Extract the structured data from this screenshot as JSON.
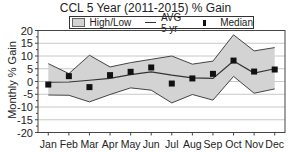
{
  "chart_data": {
    "type": "area",
    "title": "CCL 5 Year (2011-2015) % Gain",
    "xlabel": "",
    "ylabel": "Monthly % Gain",
    "ylim": [
      -20,
      20
    ],
    "yticks": [
      20,
      15,
      10,
      5,
      0,
      -5,
      -10,
      -15,
      -20
    ],
    "grid": true,
    "legend_position": "top",
    "legend": [
      "High/Low",
      "AVG 5 yr",
      "Median"
    ],
    "categories": [
      "Jan",
      "Feb",
      "Mar",
      "Apr",
      "May",
      "Jun",
      "Jul",
      "Aug",
      "Sep",
      "Oct",
      "Nov",
      "Dec"
    ],
    "series": [
      {
        "name": "High",
        "values": [
          7.0,
          3.1,
          10.3,
          5.7,
          7.4,
          8.7,
          10.0,
          6.8,
          8.0,
          18.3,
          12.0,
          13.3
        ]
      },
      {
        "name": "Low",
        "values": [
          -5.3,
          -5.4,
          -8.0,
          -5.1,
          -2.5,
          -3.4,
          -8.4,
          -5.1,
          -7.3,
          2.0,
          -4.6,
          -2.9
        ]
      },
      {
        "name": "AVG 5 yr",
        "values": [
          -0.3,
          -0.2,
          0.5,
          1.2,
          2.7,
          3.8,
          2.5,
          1.4,
          1.2,
          8.0,
          3.3,
          5.0
        ]
      },
      {
        "name": "Median",
        "values": [
          -1.2,
          2.1,
          -2.2,
          2.5,
          3.8,
          5.5,
          -0.8,
          1.2,
          3.0,
          8.2,
          3.9,
          4.7
        ]
      }
    ],
    "colors": {
      "band": "#d3d3d3",
      "band_edge": "#444444",
      "avg_line": "#333333",
      "median_marker": "#111111",
      "grid": "#c8c8c8"
    }
  }
}
